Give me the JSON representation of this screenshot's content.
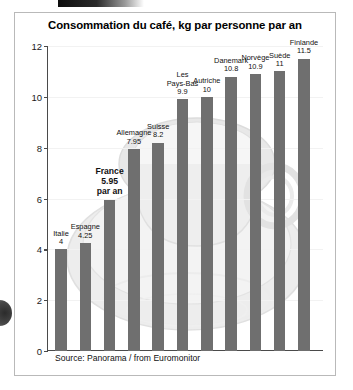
{
  "figure": {
    "title": "Consommation du café, kg par personne par an",
    "source": "Source: Panorama / from Euromonitor"
  },
  "chart_data": {
    "type": "bar",
    "title": "Consommation du café, kg par personne par an",
    "subtitle": "",
    "xlabel": "",
    "ylabel": "",
    "ylim": [
      0,
      12
    ],
    "yticks": [
      0,
      2,
      4,
      6,
      8,
      10,
      12
    ],
    "grid": true,
    "legend": "none",
    "units": "kg par personne par an",
    "bar_color": "#6f6f6f",
    "highlight": "France",
    "source": "Source: Panorama / from Euromonitor",
    "categories": [
      "Italie",
      "Espagne",
      "France",
      "Allemagne",
      "Suisse",
      "Les Pays-Bas",
      "Autriche",
      "Danemark",
      "Norvège",
      "Suède",
      "Finlande"
    ],
    "values": [
      4,
      4.25,
      5.95,
      7.95,
      8.2,
      9.9,
      10,
      10.8,
      10.9,
      11,
      11.5
    ],
    "value_labels": [
      "4",
      "4.25",
      "5.95",
      "7.95",
      "8.2",
      "9.9",
      "10",
      "10.8",
      "10.9",
      "11",
      "11.5"
    ],
    "annotations": [
      {
        "category": "France",
        "text": "par an"
      }
    ]
  },
  "bars": [
    {
      "name": "Italie",
      "value_label": "4",
      "extra": ""
    },
    {
      "name": "Espagne",
      "value_label": "4.25",
      "extra": ""
    },
    {
      "name": "France",
      "value_label": "5.95",
      "extra": "par an"
    },
    {
      "name": "Allemagne",
      "value_label": "7.95",
      "extra": ""
    },
    {
      "name": "Suisse",
      "value_label": "8.2",
      "extra": ""
    },
    {
      "name": "Les Pays-Bas",
      "value_label": "9.9",
      "extra": ""
    },
    {
      "name": "Autriche",
      "value_label": "10",
      "extra": ""
    },
    {
      "name": "Danemark",
      "value_label": "10.8",
      "extra": ""
    },
    {
      "name": "Norvège",
      "value_label": "10.9",
      "extra": ""
    },
    {
      "name": "Suède",
      "value_label": "11",
      "extra": ""
    },
    {
      "name": "Finlande",
      "value_label": "11.5",
      "extra": ""
    }
  ],
  "yticks": [
    "0",
    "2",
    "4",
    "6",
    "8",
    "10",
    "12"
  ]
}
